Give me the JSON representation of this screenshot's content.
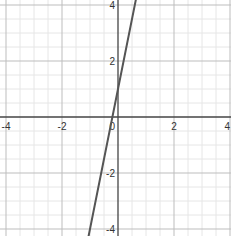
{
  "chart_data": {
    "type": "line",
    "title": "",
    "xlabel": "",
    "ylabel": "",
    "xlim": [
      -4.2,
      4.0
    ],
    "ylim": [
      -4.3,
      4.2
    ],
    "grid": true,
    "minor_grid_step": 0.5,
    "major_grid_step": 2,
    "x_tick_labels": [
      "-4",
      "-2",
      "0",
      "2",
      "4"
    ],
    "y_tick_labels": [
      "-4",
      "-2",
      "2",
      "4"
    ],
    "series": [
      {
        "name": "y = 5x + 1",
        "equation": "y = 5x + 1",
        "slope": 5,
        "intercept": 1,
        "x": [
          -1.0,
          0.6
        ],
        "y": [
          -4.0,
          4.0
        ],
        "color": "#555555"
      }
    ],
    "legend": null
  },
  "colors": {
    "axis": "#444444",
    "major_grid": "#bdbdbd",
    "minor_grid": "#e6e6e6",
    "line": "#555555",
    "label": "#333333"
  }
}
